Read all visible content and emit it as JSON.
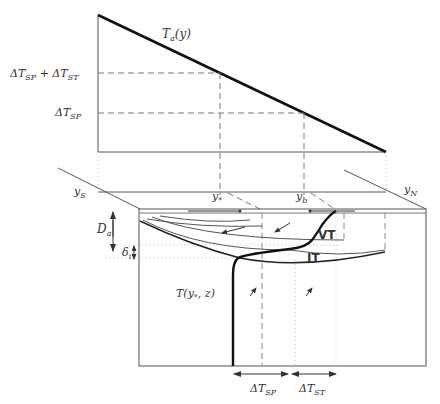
{
  "diagram": {
    "top_panel": {
      "curve_label": "T",
      "curve_label_sub": "a",
      "curve_label_arg": "(y)",
      "level_upper_label": "ΔT",
      "level_upper_sub1": "SP",
      "level_upper_plus": " + ΔT",
      "level_upper_sub2": "ST",
      "level_lower_label": "ΔT",
      "level_lower_sub": "SP"
    },
    "plane": {
      "y_south": "y",
      "y_south_sub": "S",
      "y_north": "y",
      "y_north_sub": "N",
      "y_star": "y",
      "y_star_sub": "*",
      "y_b": "y",
      "y_b_sub": "b"
    },
    "box": {
      "depth_label": "D",
      "depth_sub": "a",
      "delta_label": "δ",
      "delta_sub": "i",
      "vt_label": "VT",
      "it_label": "IT",
      "profile_label": "T(y",
      "profile_sub": "*",
      "profile_tail": ", z)"
    },
    "bottom": {
      "dtsp_label": "ΔT",
      "dtsp_sub": "SP",
      "dtst_label": "ΔT",
      "dtst_sub": "ST"
    },
    "colors": {
      "line": "#1a1a1a",
      "thin": "#555555",
      "dash": "#777777",
      "dotted": "#aaaaaa"
    }
  }
}
